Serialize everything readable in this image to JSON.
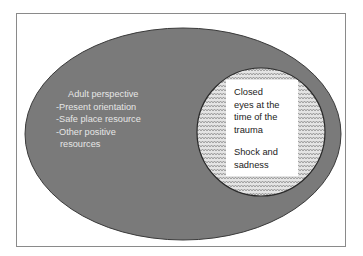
{
  "diagram": {
    "outer_ellipse": {
      "title": "Adult perspective",
      "items": [
        "-Present orientation",
        "-Safe place resource",
        "-Other positive",
        "resources"
      ],
      "fill": "#7a7a7a",
      "text_color": "#e6e6e6"
    },
    "inner_circle": {
      "lines_1": [
        "Closed",
        "eyes at the",
        "time of the",
        "trauma"
      ],
      "lines_2": [
        "Shock and",
        "sadness"
      ],
      "pattern": "zigzag-hatch"
    }
  }
}
